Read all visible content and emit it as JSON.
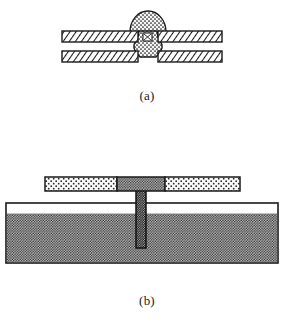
{
  "figure": {
    "background_color": "#ffffff",
    "line_color": "#1a1a1a",
    "panels": [
      {
        "id": "panel-a",
        "caption": "(a)",
        "description": "Cross-section of two hatched plates joined by a stippled dome-shaped weld nugget with a narrow waisted neck passing between the plates",
        "elements": [
          {
            "name": "upper-plate",
            "kind": "hatched-bar",
            "x": 62,
            "y": 31,
            "width": 160,
            "height": 11,
            "fill_pattern": "diagonal-hatch",
            "fill_color": "#ffffff",
            "stroke_color": "#1a1a1a"
          },
          {
            "name": "lower-plate",
            "kind": "hatched-bar",
            "x": 62,
            "y": 51,
            "width": 160,
            "height": 11,
            "fill_pattern": "diagonal-hatch",
            "fill_color": "#ffffff",
            "stroke_color": "#1a1a1a"
          },
          {
            "name": "weld-dome",
            "kind": "stippled-dome",
            "center_x": 148,
            "base_y": 31,
            "radius_x": 18,
            "radius_y": 21,
            "fill_pattern": "stipple",
            "fill_color": "#f2f2f2",
            "stroke_color": "#1a1a1a"
          },
          {
            "name": "weld-neck",
            "kind": "stippled-waist",
            "center_x": 148,
            "top_y": 31,
            "bottom_y": 58,
            "min_width": 8,
            "max_width": 19,
            "fill_pattern": "stipple",
            "fill_color": "#f2f2f2",
            "stroke_color": "#1a1a1a"
          }
        ]
      },
      {
        "id": "panel-b",
        "caption": "(b)",
        "description": "A three-segment horizontal bar above an open rectangular vessel partially filled with dense stipple, connected by a narrow dark vertical column",
        "elements": [
          {
            "name": "beam-left-segment",
            "kind": "light-stippled-bar",
            "x": 45,
            "y": 177,
            "width": 72,
            "height": 14,
            "fill_pattern": "light-stipple",
            "fill_color": "#f7f7f7",
            "stroke_color": "#1a1a1a"
          },
          {
            "name": "beam-middle-segment",
            "kind": "dark-stippled-bar",
            "x": 117,
            "y": 177,
            "width": 48,
            "height": 14,
            "fill_pattern": "dense-stipple",
            "fill_color": "#9a9a9a",
            "stroke_color": "#1a1a1a"
          },
          {
            "name": "beam-right-segment",
            "kind": "light-stippled-bar",
            "x": 165,
            "y": 177,
            "width": 75,
            "height": 14,
            "fill_pattern": "light-stipple",
            "fill_color": "#f7f7f7",
            "stroke_color": "#1a1a1a"
          },
          {
            "name": "vertical-column",
            "kind": "dark-column",
            "x": 136,
            "y": 191,
            "width": 10,
            "height": 57,
            "fill_pattern": "dense-stipple",
            "fill_color": "#8d8d8d",
            "stroke_color": "#1a1a1a"
          },
          {
            "name": "vessel-outline",
            "kind": "open-rectangle",
            "x": 6,
            "y": 203,
            "width": 272,
            "height": 60,
            "fill_color": "#ffffff",
            "stroke_color": "#1a1a1a"
          },
          {
            "name": "vessel-fill",
            "kind": "dense-stipple-fill",
            "x": 7,
            "y": 214,
            "width": 270,
            "height": 48,
            "fill_pattern": "dense-stipple",
            "fill_color": "#9c9c9c",
            "level_label": "fill-level"
          }
        ]
      }
    ]
  },
  "captions": {
    "panel_a": "(a)",
    "panel_b": "(b)"
  }
}
